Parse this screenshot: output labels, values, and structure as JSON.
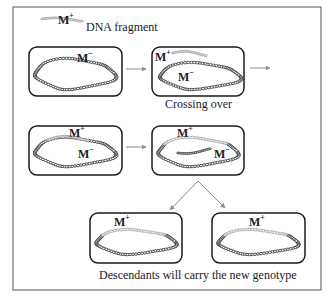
{
  "legend": {
    "label": "DNA fragment",
    "fragment_marker": {
      "gene": "M",
      "allele": "+"
    }
  },
  "steps": [
    {
      "id": "cell-1",
      "labels": [
        {
          "gene": "M",
          "allele": "−"
        }
      ]
    },
    {
      "id": "cell-2",
      "labels": [
        {
          "gene": "M",
          "allele": "+"
        },
        {
          "gene": "M",
          "allele": "−"
        }
      ],
      "caption": "Crossing over"
    },
    {
      "id": "cell-3",
      "labels": [
        {
          "gene": "M",
          "allele": "+"
        },
        {
          "gene": "M",
          "allele": "−"
        }
      ]
    },
    {
      "id": "cell-4",
      "labels": [
        {
          "gene": "M",
          "allele": "+"
        },
        {
          "gene": "M",
          "allele": "−"
        }
      ]
    },
    {
      "id": "cell-5",
      "labels": [
        {
          "gene": "M",
          "allele": "+"
        }
      ]
    },
    {
      "id": "cell-6",
      "labels": [
        {
          "gene": "M",
          "allele": "+"
        }
      ]
    }
  ],
  "captions": {
    "crossing_over": "Crossing over",
    "descendants": "Descendants will carry the new genotype"
  },
  "colors": {
    "frame": "#555555",
    "cell_border": "#1a1a1a",
    "chromosome": "#2a2a2a",
    "fragment": "#9a9a9a",
    "arrow": "#8c8c8c"
  }
}
